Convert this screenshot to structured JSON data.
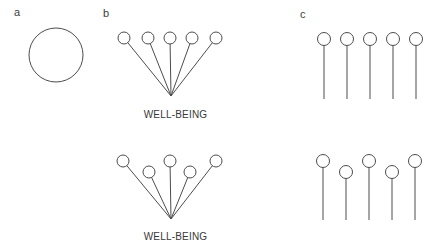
{
  "figure": {
    "background_color": "#ffffff",
    "stroke_color": "#4d4d4d",
    "stroke_width": 1,
    "panel_a": {
      "label": "a",
      "label_pos": [
        14,
        7
      ],
      "circle": {
        "cx": 56,
        "cy": 55,
        "r": 27
      }
    },
    "panel_b": {
      "label": "b",
      "label_pos": [
        103,
        8
      ],
      "caption": "WELL-BEING",
      "caption_tops": [
        110,
        232
      ],
      "node_radius": 6,
      "top": {
        "circles": [
          [
            124,
            38
          ],
          [
            148,
            38
          ],
          [
            170,
            38
          ],
          [
            192,
            38
          ],
          [
            216,
            38
          ]
        ],
        "converge": [
          171,
          96
        ]
      },
      "bottom": {
        "circles": [
          [
            123,
            161
          ],
          [
            149,
            172
          ],
          [
            170,
            161
          ],
          [
            190,
            172
          ],
          [
            216,
            161
          ]
        ],
        "converge": [
          171,
          219
        ]
      }
    },
    "panel_c": {
      "label": "c",
      "label_pos": [
        300,
        9
      ],
      "node_radius": 6.5,
      "top": {
        "circles": [
          [
            324,
            39
          ],
          [
            347,
            39
          ],
          [
            370,
            39
          ],
          [
            393,
            39
          ],
          [
            416,
            39
          ]
        ],
        "line_bottom_y": 99
      },
      "bottom": {
        "circles": [
          [
            323,
            161
          ],
          [
            346,
            172
          ],
          [
            369,
            161
          ],
          [
            392,
            172
          ],
          [
            415,
            161
          ]
        ],
        "line_bottom_y": 220
      }
    }
  }
}
